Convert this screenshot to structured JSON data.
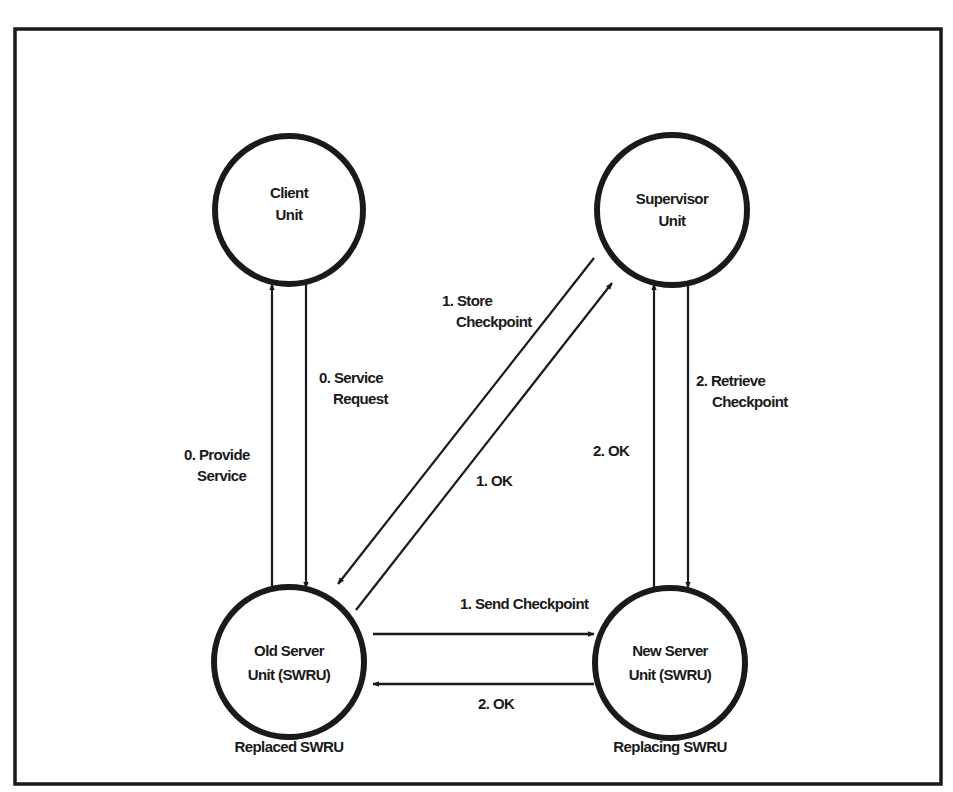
{
  "diagram": {
    "title": "",
    "colors": {
      "ink": "#1a1a1a",
      "background": "#ffffff"
    },
    "nodes": [
      {
        "id": "client",
        "line1": "Client",
        "line2": "Unit",
        "role": ""
      },
      {
        "id": "supervisor",
        "line1": "Supervisor",
        "line2": "Unit",
        "role": ""
      },
      {
        "id": "old-server",
        "line1": "Old Server",
        "line2": "Unit (SWRU)",
        "role": "Replaced SWRU"
      },
      {
        "id": "new-server",
        "line1": "New Server",
        "line2": "Unit (SWRU)",
        "role": "Replacing SWRU"
      }
    ],
    "edges": [
      {
        "id": "provide-service",
        "from": "old-server",
        "to": "client",
        "line1": "0. Provide",
        "line2": "Service"
      },
      {
        "id": "service-request",
        "from": "client",
        "to": "old-server",
        "line1": "0. Service",
        "line2": "Request"
      },
      {
        "id": "store-checkpoint",
        "from": "supervisor",
        "to": "old-server",
        "line1": "1. Store",
        "line2": "Checkpoint"
      },
      {
        "id": "ok-1-supervisor",
        "from": "old-server",
        "to": "supervisor",
        "line1": "1. OK",
        "line2": ""
      },
      {
        "id": "retrieve-checkpoint",
        "from": "supervisor",
        "to": "new-server",
        "line1": "2. Retrieve",
        "line2": "Checkpoint"
      },
      {
        "id": "ok-2-supervisor",
        "from": "new-server",
        "to": "supervisor",
        "line1": "2. OK",
        "line2": ""
      },
      {
        "id": "send-checkpoint",
        "from": "old-server",
        "to": "new-server",
        "line1": "1. Send Checkpoint",
        "line2": ""
      },
      {
        "id": "ok-2-server",
        "from": "new-server",
        "to": "old-server",
        "line1": "2. OK",
        "line2": ""
      }
    ]
  }
}
